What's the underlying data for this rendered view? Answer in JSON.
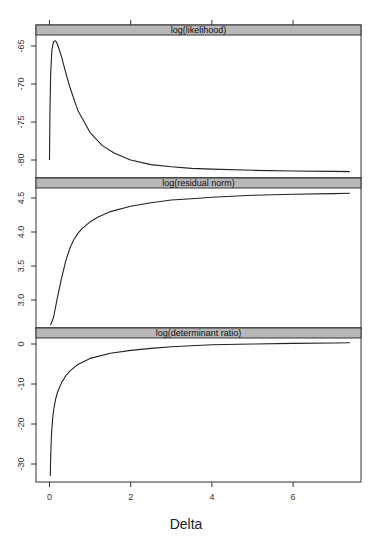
{
  "chart_data": {
    "type": "line",
    "layout": "lattice-stacked-panels",
    "xlabel": "Delta",
    "x_ticks": [
      0,
      2,
      4,
      6
    ],
    "xlim": [
      -0.3,
      7.7
    ],
    "grid": false,
    "legend": null,
    "strip_color": "#b8b8b8",
    "panels": [
      {
        "title": "log(likelihood)",
        "y_ticks": [
          -65,
          -70,
          -75,
          -80
        ],
        "ylim": [
          -82.0,
          -63.5
        ],
        "series": [
          {
            "name": "log(likelihood)",
            "x": [
              0.0,
              0.01,
              0.03,
              0.06,
              0.1,
              0.15,
              0.2,
              0.3,
              0.4,
              0.5,
              0.7,
              1.0,
              1.3,
              1.6,
              2.0,
              2.5,
              3.0,
              3.5,
              4.0,
              5.0,
              6.0,
              7.0,
              7.4
            ],
            "y": [
              -80.0,
              -74.0,
              -68.5,
              -65.5,
              -64.4,
              -64.3,
              -64.8,
              -66.5,
              -68.5,
              -70.4,
              -73.5,
              -76.4,
              -78.1,
              -79.1,
              -80.0,
              -80.6,
              -80.9,
              -81.1,
              -81.2,
              -81.35,
              -81.45,
              -81.5,
              -81.52
            ]
          }
        ]
      },
      {
        "title": "log(residual norm)",
        "y_ticks": [
          4.5,
          4.0,
          3.5,
          3.0
        ],
        "ylim": [
          2.58,
          4.65
        ],
        "series": [
          {
            "name": "log(residual norm)",
            "x": [
              0.02,
              0.05,
              0.1,
              0.2,
              0.3,
              0.4,
              0.5,
              0.6,
              0.7,
              0.8,
              1.0,
              1.2,
              1.5,
              2.0,
              2.5,
              3.0,
              3.5,
              4.0,
              5.0,
              6.0,
              7.0,
              7.4
            ],
            "y": [
              2.63,
              2.66,
              2.75,
              3.05,
              3.33,
              3.57,
              3.76,
              3.89,
              3.98,
              4.05,
              4.15,
              4.22,
              4.3,
              4.38,
              4.43,
              4.47,
              4.49,
              4.51,
              4.54,
              4.555,
              4.565,
              4.57
            ]
          }
        ]
      },
      {
        "title": "log(determinant ratio)",
        "y_ticks": [
          0,
          -10,
          -20,
          -30
        ],
        "ylim": [
          -34.5,
          2.0
        ],
        "series": [
          {
            "name": "log(determinant ratio)",
            "x": [
              0.02,
              0.03,
              0.05,
              0.08,
              0.1,
              0.15,
              0.2,
              0.3,
              0.4,
              0.5,
              0.7,
              1.0,
              1.5,
              2.0,
              2.5,
              3.0,
              4.0,
              5.0,
              6.0,
              7.0,
              7.4
            ],
            "y": [
              -33.0,
              -28.0,
              -22.5,
              -18.5,
              -16.5,
              -13.8,
              -12.0,
              -9.6,
              -8.0,
              -6.8,
              -5.1,
              -3.6,
              -2.3,
              -1.6,
              -1.1,
              -0.7,
              -0.2,
              0.0,
              0.15,
              0.25,
              0.3
            ]
          }
        ]
      }
    ]
  }
}
